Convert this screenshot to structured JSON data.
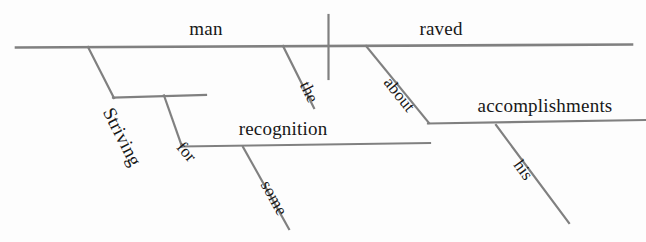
{
  "diagram": {
    "sentence": "Striving for some recognition, the man raved about his accomplishments.",
    "line_color": "#808080",
    "text_color": "#181818",
    "background_color": "#fdfdfd",
    "baseline_words": [
      {
        "id": "subject",
        "label": "man",
        "role": "subject",
        "x": 206,
        "y": 40,
        "size": 19,
        "rotation": 0
      },
      {
        "id": "predicate",
        "label": "raved",
        "role": "verb",
        "x": 441,
        "y": 40,
        "size": 19,
        "rotation": 0
      },
      {
        "id": "object-of-preposition-1",
        "label": "recognition",
        "role": "object of preposition",
        "x": 283,
        "y": 140,
        "size": 19,
        "rotation": 0
      },
      {
        "id": "object-of-preposition-2",
        "label": "accomplishments",
        "role": "object of preposition",
        "x": 545,
        "y": 117,
        "size": 19,
        "rotation": 0
      }
    ],
    "slanted_words": [
      {
        "id": "participle",
        "label": "Striving",
        "role": "participle",
        "x": 98,
        "y": 92,
        "size": 19,
        "rotation": 63
      },
      {
        "id": "preposition-for",
        "label": "for",
        "role": "preposition",
        "x": 172,
        "y": 131,
        "size": 17,
        "rotation": 49
      },
      {
        "id": "modifier-some",
        "label": "some",
        "role": "adjective",
        "x": 256,
        "y": 167,
        "size": 17,
        "rotation": 61
      },
      {
        "id": "article-the",
        "label": "the",
        "role": "article",
        "x": 295,
        "y": 67,
        "size": 17,
        "rotation": 64
      },
      {
        "id": "preposition-about",
        "label": "about",
        "role": "preposition",
        "x": 379,
        "y": 66,
        "size": 17,
        "rotation": 51
      },
      {
        "id": "possessive-his",
        "label": "his",
        "role": "possessive adjective",
        "x": 509,
        "y": 148,
        "size": 17,
        "rotation": 54
      }
    ],
    "lines": [
      {
        "id": "main-baseline",
        "x1": 16,
        "y1": 47.5,
        "x2": 632,
        "y2": 44.5,
        "width": 2.6
      },
      {
        "id": "subject-verb-divider",
        "x1": 328.5,
        "y1": 15,
        "x2": 328.5,
        "y2": 79,
        "width": 2.2
      },
      {
        "id": "participle-slant",
        "x1": 88,
        "y1": 47,
        "x2": 114,
        "y2": 98,
        "width": 2.2
      },
      {
        "id": "participle-baseline",
        "x1": 113,
        "y1": 97.5,
        "x2": 206,
        "y2": 95,
        "width": 2.2
      },
      {
        "id": "for-slant",
        "x1": 164,
        "y1": 95.5,
        "x2": 182,
        "y2": 146.5,
        "width": 2.2
      },
      {
        "id": "recognition-baseline",
        "x1": 181,
        "y1": 146.5,
        "x2": 430,
        "y2": 143,
        "width": 2.2
      },
      {
        "id": "some-slant",
        "x1": 243,
        "y1": 147,
        "x2": 289,
        "y2": 229,
        "width": 2.2
      },
      {
        "id": "the-slant",
        "x1": 283,
        "y1": 46,
        "x2": 314,
        "y2": 108,
        "width": 2.2
      },
      {
        "id": "about-slant",
        "x1": 366,
        "y1": 46,
        "x2": 429,
        "y2": 123,
        "width": 2.2
      },
      {
        "id": "accomplishments-baseline",
        "x1": 428,
        "y1": 123.5,
        "x2": 645,
        "y2": 120,
        "width": 2.2
      },
      {
        "id": "his-slant",
        "x1": 496,
        "y1": 125,
        "x2": 569,
        "y2": 223,
        "width": 2.2
      }
    ]
  }
}
